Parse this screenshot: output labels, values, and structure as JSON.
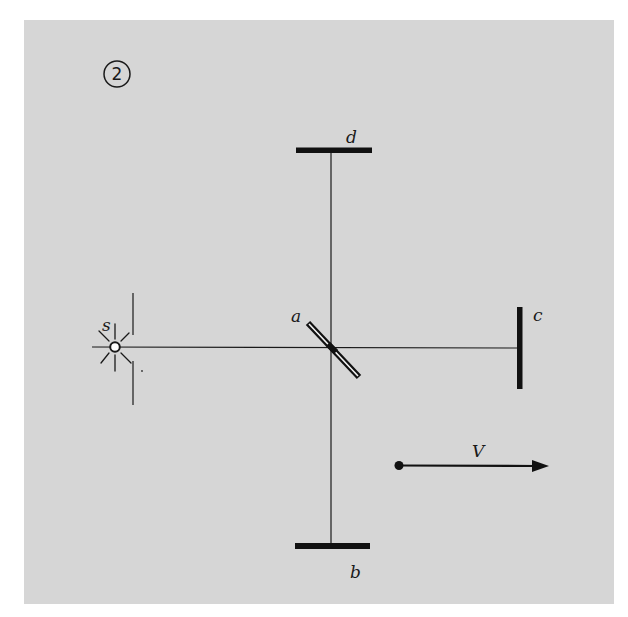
{
  "figure": {
    "number": "2",
    "colors": {
      "background": "#ffffff",
      "panel": "#d6d6d6",
      "ink": "#1a1a1a"
    }
  },
  "labels": {
    "source": "s",
    "beam_splitter": "a",
    "mirror_bottom": "b",
    "mirror_right": "c",
    "mirror_top": "d",
    "velocity": "V"
  },
  "components": [
    {
      "id": "s",
      "type": "light-source",
      "x": 115,
      "y": 347
    },
    {
      "id": "a",
      "type": "half-silvered-mirror",
      "x": 333,
      "y": 350,
      "angle_deg": 45
    },
    {
      "id": "b",
      "type": "mirror",
      "x": 332,
      "y": 546,
      "orientation": "horizontal"
    },
    {
      "id": "c",
      "type": "mirror",
      "x": 520,
      "y": 348,
      "orientation": "vertical"
    },
    {
      "id": "d",
      "type": "mirror",
      "x": 334,
      "y": 150,
      "orientation": "horizontal"
    }
  ],
  "velocity_arrow": {
    "from": [
      399,
      465
    ],
    "to": [
      548,
      466
    ],
    "direction": "right"
  }
}
